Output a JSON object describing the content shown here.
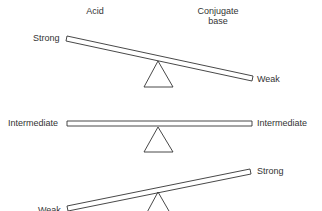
{
  "headers": {
    "acid": "Acid",
    "conjugate_base_line1": "Conjugate",
    "conjugate_base_line2": "base"
  },
  "seesaws": [
    {
      "left_label": "Strong",
      "right_label": "Weak",
      "tilt": "left-high"
    },
    {
      "left_label": "Intermediate",
      "right_label": "Intermediate",
      "tilt": "level"
    },
    {
      "left_label": "Weak",
      "right_label": "Strong",
      "tilt": "right-high"
    }
  ],
  "colors": {
    "line": "#333333",
    "background": "#ffffff"
  }
}
